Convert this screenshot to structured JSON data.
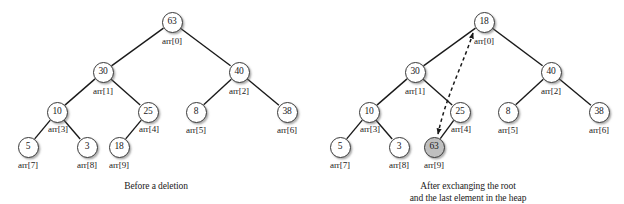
{
  "figure": {
    "background_color": "#ffffff",
    "node_fill": "#ffffff",
    "node_shaded_fill": "#bfbfbf",
    "edge_color": "#1a1a1a"
  },
  "panels": [
    {
      "id": "before",
      "caption_lines": [
        "Before a deletion"
      ],
      "nodes": [
        {
          "name": "root",
          "value": "63",
          "index_label": "arr[0]",
          "x": 172,
          "y": 22,
          "lx": 172,
          "ly": 41,
          "shaded": false
        },
        {
          "name": "left-child",
          "value": "30",
          "index_label": "arr[1]",
          "x": 103,
          "y": 72,
          "lx": 103,
          "ly": 91,
          "shaded": false
        },
        {
          "name": "right-child",
          "value": "40",
          "index_label": "arr[2]",
          "x": 239,
          "y": 72,
          "lx": 239,
          "ly": 91,
          "shaded": false
        },
        {
          "name": "node-10",
          "value": "10",
          "index_label": "arr[3]",
          "x": 57,
          "y": 112,
          "lx": 58,
          "ly": 129,
          "shaded": false
        },
        {
          "name": "node-25",
          "value": "25",
          "index_label": "arr[4]",
          "x": 148,
          "y": 112,
          "lx": 149,
          "ly": 129,
          "shaded": false
        },
        {
          "name": "node-8",
          "value": "8",
          "index_label": "arr[5]",
          "x": 196,
          "y": 112,
          "lx": 196,
          "ly": 130,
          "shaded": false
        },
        {
          "name": "node-38",
          "value": "38",
          "index_label": "arr[6]",
          "x": 287,
          "y": 112,
          "lx": 287,
          "ly": 130,
          "shaded": false
        },
        {
          "name": "node-5",
          "value": "5",
          "index_label": "arr[7]",
          "x": 28,
          "y": 147,
          "lx": 28,
          "ly": 165,
          "shaded": false
        },
        {
          "name": "node-3",
          "value": "3",
          "index_label": "arr[8]",
          "x": 87,
          "y": 147,
          "lx": 87,
          "ly": 165,
          "shaded": false
        },
        {
          "name": "node-18",
          "value": "18",
          "index_label": "arr[9]",
          "x": 119,
          "y": 147,
          "lx": 119,
          "ly": 165,
          "shaded": false
        }
      ],
      "edges": [
        [
          172,
          22,
          103,
          72
        ],
        [
          172,
          22,
          239,
          72
        ],
        [
          103,
          72,
          57,
          112
        ],
        [
          103,
          72,
          148,
          112
        ],
        [
          239,
          72,
          196,
          112
        ],
        [
          239,
          72,
          287,
          112
        ],
        [
          57,
          112,
          28,
          147
        ],
        [
          57,
          112,
          87,
          147
        ],
        [
          148,
          112,
          119,
          147
        ]
      ],
      "exchange_arrow": null
    },
    {
      "id": "after",
      "caption_lines": [
        "After exchanging the root",
        "and the last element in the heap"
      ],
      "nodes": [
        {
          "name": "root",
          "value": "18",
          "index_label": "arr[0]",
          "x": 172,
          "y": 22,
          "lx": 172,
          "ly": 41,
          "shaded": false
        },
        {
          "name": "left-child",
          "value": "30",
          "index_label": "arr[1]",
          "x": 103,
          "y": 72,
          "lx": 103,
          "ly": 91,
          "shaded": false
        },
        {
          "name": "right-child",
          "value": "40",
          "index_label": "arr[2]",
          "x": 239,
          "y": 72,
          "lx": 239,
          "ly": 91,
          "shaded": false
        },
        {
          "name": "node-10",
          "value": "10",
          "index_label": "arr[3]",
          "x": 57,
          "y": 112,
          "lx": 58,
          "ly": 129,
          "shaded": false
        },
        {
          "name": "node-25",
          "value": "25",
          "index_label": "arr[4]",
          "x": 148,
          "y": 112,
          "lx": 149,
          "ly": 129,
          "shaded": false
        },
        {
          "name": "node-8",
          "value": "8",
          "index_label": "arr[5]",
          "x": 196,
          "y": 112,
          "lx": 196,
          "ly": 130,
          "shaded": false
        },
        {
          "name": "node-38",
          "value": "38",
          "index_label": "arr[6]",
          "x": 287,
          "y": 112,
          "lx": 287,
          "ly": 130,
          "shaded": false
        },
        {
          "name": "node-5",
          "value": "5",
          "index_label": "arr[7]",
          "x": 28,
          "y": 147,
          "lx": 28,
          "ly": 165,
          "shaded": false
        },
        {
          "name": "node-3",
          "value": "3",
          "index_label": "arr[8]",
          "x": 87,
          "y": 147,
          "lx": 87,
          "ly": 165,
          "shaded": false
        },
        {
          "name": "node-63",
          "value": "63",
          "index_label": "arr[9]",
          "x": 122,
          "y": 147,
          "lx": 122,
          "ly": 165,
          "shaded": true
        }
      ],
      "edges": [
        [
          172,
          22,
          103,
          72
        ],
        [
          172,
          22,
          239,
          72
        ],
        [
          103,
          72,
          57,
          112
        ],
        [
          103,
          72,
          148,
          112
        ],
        [
          239,
          72,
          196,
          112
        ],
        [
          239,
          72,
          287,
          112
        ],
        [
          57,
          112,
          28,
          147
        ],
        [
          57,
          112,
          87,
          147
        ],
        [
          148,
          112,
          122,
          147
        ]
      ],
      "exchange_arrow": {
        "name": "swap-arrow",
        "style": "dashed-double-headed-curve",
        "path": "M 161,33 C 152,62 134,96 126,134"
      }
    }
  ]
}
